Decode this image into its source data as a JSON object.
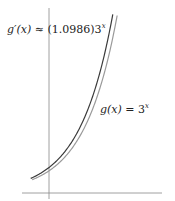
{
  "figure": {
    "labels": {
      "derivative": {
        "lhs": "g′(x)",
        "op": "≈",
        "coef": "(1.0986)3",
        "exp": "x"
      },
      "function": {
        "lhs": "g(x)",
        "op": "=",
        "base": "3",
        "exp": "x"
      }
    },
    "colors": {
      "derivative_curve": "#3a3a3a",
      "function_curve": "#9a9a9a",
      "axes": "#888888"
    }
  },
  "chart_data": {
    "type": "line",
    "title": "",
    "series": [
      {
        "name": "g(x) = 3^x",
        "x": [
          -0.5,
          0,
          0.5,
          1,
          1.5,
          1.86
        ],
        "y": [
          0.58,
          1,
          1.73,
          3,
          5.2,
          7.7
        ]
      },
      {
        "name": "g'(x) ≈ (1.0986)3^x",
        "x": [
          -0.5,
          0,
          0.5,
          1,
          1.5,
          1.8
        ],
        "y": [
          0.63,
          1.1,
          1.9,
          3.3,
          5.7,
          7.7
        ]
      }
    ],
    "xlabel": "",
    "ylabel": "",
    "grid": false,
    "legend": "inline labels"
  }
}
